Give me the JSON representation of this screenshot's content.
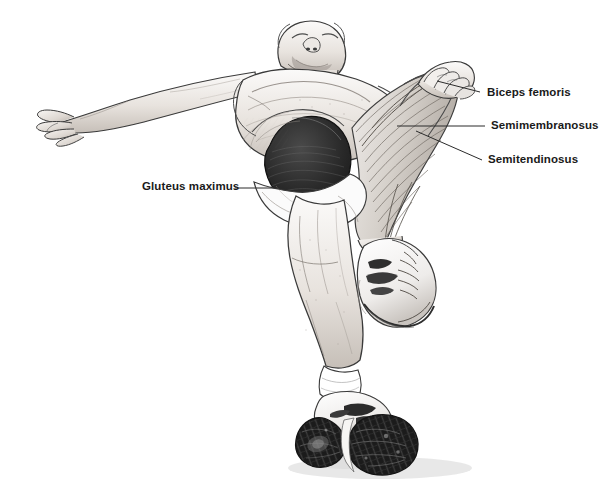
{
  "figure": {
    "background_color": "#ffffff",
    "style": "graphite pencil medical illustration",
    "view": "low worm's-eye view from below and behind"
  },
  "labels": [
    {
      "id": "biceps-femoris",
      "text": "Biceps femoris",
      "leader": {
        "x1": 480,
        "y1": 92,
        "x2": 437,
        "y2": 81
      }
    },
    {
      "id": "semimembranosus",
      "text": "Semimembranosus",
      "leader": {
        "x1": 485,
        "y1": 126,
        "x2": 397,
        "y2": 126
      }
    },
    {
      "id": "semitendinosus",
      "text": "Semitendinosus",
      "leader": {
        "x1": 482,
        "y1": 160,
        "x2": 416,
        "y2": 131
      }
    },
    {
      "id": "gluteus-maximus",
      "text": "Gluteus maximus",
      "leader": {
        "x1": 235,
        "y1": 188,
        "x2": 288,
        "y2": 188
      }
    }
  ],
  "colors": {
    "line": "#2b2b2b",
    "label_text": "#1a1a1a",
    "gluteus_fill": "#242424",
    "skin_light": "#f7f5f3",
    "skin_mid": "#ded9d4",
    "skin_shadow": "#b9b2ab",
    "muscle_light": "#e9e6e2",
    "muscle_mid": "#cfcac4",
    "shorts": "#fbfbfb",
    "sole_dark": "#1e1e1e",
    "shoe_light": "#f4f3f1",
    "ground_shadow": "#ededed"
  },
  "anatomy_parts": [
    {
      "name": "head",
      "note": "bearded face, chin raised, seen from below"
    },
    {
      "name": "left-arm-extended",
      "note": "arm extended horizontally to the left with relaxed hand"
    },
    {
      "name": "torso",
      "note": "bare chest foreshortened"
    },
    {
      "name": "right-hand-grip",
      "note": "hand gripping the raised thigh hamstrings"
    },
    {
      "name": "gluteus-maximus-muscle",
      "note": "dark fan-shaped hip muscle with fiber striations"
    },
    {
      "name": "hamstring-group",
      "note": "long parallel stretched fibers of biceps femoris, semimembranosus, semitendinosus"
    },
    {
      "name": "standing-leg",
      "note": "weight-bearing leg with visible calf and ankle sock"
    },
    {
      "name": "raised-foot-shoe",
      "note": "sneaker with laces and dark side stripes"
    },
    {
      "name": "standing-foot-sole",
      "note": "shoe sole seen from below with dark tread pattern"
    }
  ]
}
